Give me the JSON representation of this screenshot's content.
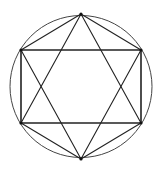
{
  "diagram": {
    "stroke_color": "#222222",
    "circle": {
      "cx": 81,
      "cy": 86.5,
      "r": 71
    },
    "vertices": {
      "top": [
        81,
        14
      ],
      "upper_right": [
        141,
        50
      ],
      "lower_right": [
        141,
        123
      ],
      "bottom": [
        81,
        159
      ],
      "lower_left": [
        21,
        123
      ],
      "upper_left": [
        21,
        50
      ]
    }
  }
}
